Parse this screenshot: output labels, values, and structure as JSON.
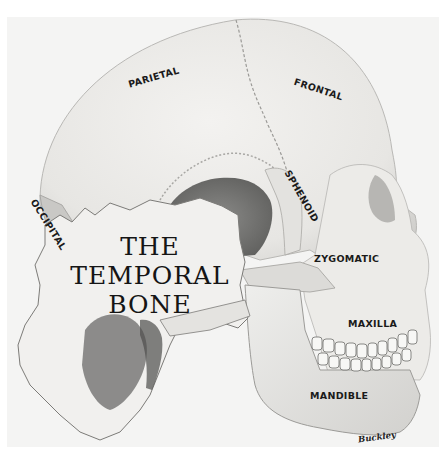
{
  "title": {
    "line1": "THE",
    "line2": "TEMPORAL",
    "line3": "BONE"
  },
  "labels": {
    "parietal": "PARIETAL",
    "frontal": "FRONTAL",
    "sphenoid": "SPHENOID",
    "occipital": "OCCIPITAL",
    "zygomatic": "ZYGOMATIC",
    "maxilla": "MAXILLA",
    "mandible": "MANDIBLE"
  },
  "signature": "Buckley",
  "colors": {
    "background": "#f4f4f3",
    "bone": "#ecebe8",
    "shadow": "#8e8e8c",
    "text": "#1a1a1a"
  }
}
